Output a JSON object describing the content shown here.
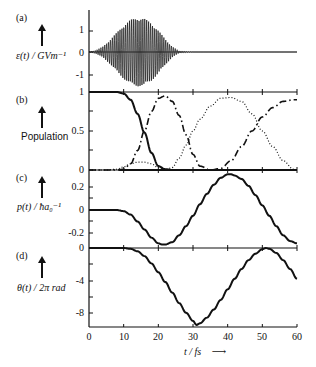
{
  "figure": {
    "panels": [
      {
        "id": "a",
        "letter": "(a)",
        "ylabel": "ε(t) / GVm⁻¹",
        "yticks": [
          "1",
          "0",
          "-1"
        ]
      },
      {
        "id": "b",
        "letter": "(b)",
        "ylabel": "Population",
        "yticks": [
          "1",
          "0.5",
          "0"
        ]
      },
      {
        "id": "c",
        "letter": "(c)",
        "ylabel": "p(t) / ħa₀⁻¹",
        "yticks": [
          "0.2",
          "0",
          "-0.2"
        ]
      },
      {
        "id": "d",
        "letter": "(d)",
        "ylabel": "θ(t) / 2π rad",
        "yticks": [
          "0",
          "-4",
          "-8"
        ]
      }
    ],
    "xaxis": {
      "label": "t / fs",
      "arrow": "→",
      "ticks": [
        "0",
        "10",
        "20",
        "30",
        "40",
        "50",
        "60"
      ]
    }
  },
  "chart_data": [
    {
      "type": "line",
      "panel": "(a)",
      "title": "",
      "ylabel": "ε(t) / GVm^-1",
      "xlabel": "t / fs",
      "description": "Rapidly oscillating laser pulse with Gaussian-like envelope centered ~14 fs, duration ~0-25 fs",
      "x": [
        0,
        2,
        4,
        6,
        8,
        10,
        12,
        14,
        16,
        18,
        20,
        22,
        24,
        26,
        30,
        40,
        50,
        60
      ],
      "envelope": [
        0.0,
        0.08,
        0.25,
        0.55,
        0.9,
        1.25,
        1.5,
        1.6,
        1.55,
        1.35,
        1.0,
        0.6,
        0.25,
        0.05,
        0,
        0,
        0,
        0
      ],
      "ylim": [
        -1.6,
        1.6
      ],
      "xlim": [
        0,
        60
      ]
    },
    {
      "type": "line",
      "panel": "(b)",
      "ylabel": "Population",
      "xlabel": "t / fs",
      "x": [
        0,
        5,
        8,
        10,
        12,
        14,
        16,
        18,
        20,
        22,
        24,
        26,
        28,
        30,
        32,
        35,
        38,
        41,
        44,
        47,
        50,
        53,
        56,
        59,
        60
      ],
      "series": [
        {
          "name": "solid",
          "style": "solid",
          "values": [
            1,
            1,
            1,
            0.98,
            0.9,
            0.72,
            0.48,
            0.22,
            0.05,
            0.01,
            0,
            0,
            0,
            0,
            0,
            0,
            0,
            0,
            0,
            0,
            0,
            0,
            0,
            0,
            0
          ]
        },
        {
          "name": "dash-dot",
          "style": "dash-dot",
          "values": [
            0,
            0,
            0,
            0.01,
            0.08,
            0.25,
            0.5,
            0.75,
            0.92,
            0.95,
            0.88,
            0.7,
            0.45,
            0.2,
            0.05,
            0.0,
            0.02,
            0.12,
            0.3,
            0.5,
            0.68,
            0.8,
            0.88,
            0.9,
            0.9
          ]
        },
        {
          "name": "dotted",
          "style": "dotted",
          "values": [
            0,
            0,
            0.01,
            0.04,
            0.08,
            0.1,
            0.1,
            0.08,
            0.03,
            0.0,
            0.03,
            0.15,
            0.32,
            0.5,
            0.65,
            0.82,
            0.92,
            0.93,
            0.88,
            0.72,
            0.5,
            0.3,
            0.12,
            0.01,
            0
          ]
        }
      ],
      "ylim": [
        0,
        1
      ],
      "xlim": [
        0,
        60
      ]
    },
    {
      "type": "line",
      "panel": "(c)",
      "ylabel": "p(t) / ħa0^-1",
      "xlabel": "t / fs",
      "x": [
        0,
        4,
        8,
        10,
        12,
        14,
        16,
        18,
        20,
        21,
        22,
        24,
        26,
        28,
        30,
        32,
        34,
        36,
        38,
        40,
        41,
        42,
        44,
        46,
        48,
        50,
        52,
        54,
        56,
        58,
        60
      ],
      "values": [
        0,
        0,
        0,
        -0.01,
        -0.04,
        -0.1,
        -0.17,
        -0.24,
        -0.29,
        -0.3,
        -0.3,
        -0.28,
        -0.22,
        -0.14,
        -0.05,
        0.05,
        0.14,
        0.22,
        0.28,
        0.31,
        0.31,
        0.3,
        0.27,
        0.21,
        0.13,
        0.04,
        -0.05,
        -0.14,
        -0.22,
        -0.27,
        -0.29
      ],
      "ylim": [
        -0.3,
        0.32
      ],
      "xlim": [
        0,
        60
      ]
    },
    {
      "type": "line",
      "panel": "(d)",
      "ylabel": "θ(t) / 2π rad",
      "xlabel": "t / fs",
      "x": [
        0,
        5,
        10,
        12,
        14,
        16,
        18,
        20,
        22,
        24,
        26,
        28,
        30,
        31,
        32,
        34,
        36,
        38,
        40,
        42,
        44,
        46,
        48,
        50,
        51,
        52,
        54,
        56,
        58,
        60
      ],
      "values": [
        0,
        0,
        0,
        -0.1,
        -0.4,
        -1.0,
        -1.9,
        -3.0,
        -4.2,
        -5.5,
        -6.8,
        -8.0,
        -9.0,
        -9.5,
        -9.3,
        -8.6,
        -7.6,
        -6.4,
        -5.1,
        -3.8,
        -2.6,
        -1.5,
        -0.7,
        -0.15,
        0,
        -0.1,
        -0.6,
        -1.5,
        -2.6,
        -3.8
      ],
      "ylim": [
        -9.6,
        0.2
      ],
      "xlim": [
        0,
        60
      ]
    }
  ]
}
